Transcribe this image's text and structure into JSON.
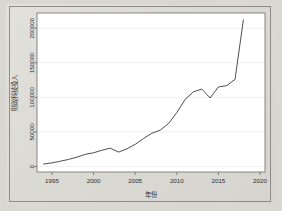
{
  "figure": {
    "background_color": "#d9d7d2",
    "plot_background_color": "#ffffff",
    "frame_color": "#6f6d6a",
    "line_color": "#3a3a3a",
    "grid_color": "#e6e6e6"
  },
  "chart_data": {
    "type": "line",
    "title": "",
    "xlabel": "年份",
    "ylabel": "财政科技投入",
    "xlim": [
      1993.2,
      2020.6
    ],
    "ylim": [
      -8000,
      222000
    ],
    "grid": true,
    "legend": "none",
    "xticks": [
      "1995",
      "2000",
      "2005",
      "2010",
      "2015",
      "2020"
    ],
    "xtick_values": [
      1995,
      2000,
      2005,
      2010,
      2015,
      2020
    ],
    "yticks": [
      "0",
      "50000",
      "100000",
      "150000",
      "200000"
    ],
    "ytick_values": [
      0,
      50000,
      100000,
      150000,
      200000
    ],
    "x": [
      1994,
      1995,
      1996,
      1997,
      1998,
      1999,
      2000,
      2001,
      2002,
      2003,
      2004,
      2005,
      2006,
      2007,
      2008,
      2009,
      2010,
      2011,
      2012,
      2013,
      2014,
      2015,
      2016,
      2017,
      2018
    ],
    "series": [
      {
        "name": "财政科技投入",
        "values": [
          3500,
          5200,
          7600,
          10200,
          13500,
          17500,
          19800,
          23500,
          26500,
          20800,
          25500,
          32000,
          40500,
          48000,
          52500,
          62000,
          78000,
          97000,
          108000,
          112000,
          99000,
          115000,
          117000,
          126000,
          212000
        ]
      }
    ]
  }
}
